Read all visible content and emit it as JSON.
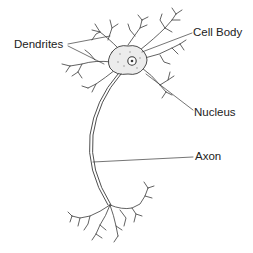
{
  "diagram": {
    "labels": {
      "dendrites": "Dendrites",
      "cell_body": "Cell Body",
      "nucleus": "Nucleus",
      "axon": "Axon"
    },
    "colors": {
      "background": "#ffffff",
      "line": "#3a3a3a",
      "cell_fill": "#ececec",
      "text": "#222222"
    }
  }
}
